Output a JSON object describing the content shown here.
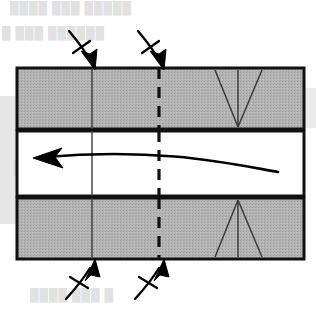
{
  "figure": {
    "kind": "technical-line-diagram",
    "scan_artifacts": {
      "ghost_text_visible": true,
      "ghost_lines": [
        "████ ███ █████",
        "█  ███  ██████",
        "███████  ████",
        "████  ███  █"
      ]
    },
    "colors": {
      "background": "#ffffff",
      "layer_fill": "#b2b2b2",
      "layer_stroke": "#111111",
      "interior_line": "#333333",
      "arrow": "#000000",
      "ghost_text": "#c9c9c9"
    },
    "geometry": {
      "block_left": 17,
      "block_right": 304,
      "top_band": {
        "y_top": 68,
        "y_bottom": 129,
        "label": "upper-layer"
      },
      "middle_band": {
        "y_top": 131,
        "y_bottom": 196,
        "label": "middle-layer"
      },
      "bottom_band": {
        "y_top": 198,
        "y_bottom": 259,
        "label": "lower-layer"
      },
      "solid_vertical_x": 92,
      "dashed_vertical_x": 159,
      "wedge_apex_x": 238
    },
    "elements": {
      "upper_layer": "upper shaded layer",
      "middle_layer": "middle unshaded layer",
      "lower_layer": "lower shaded layer",
      "solid_reference_line": "solid vertical reference line",
      "dashed_axial_line": "dashed vertical axial-plane line",
      "upper_wedge": "downward-converging wedge in upper layer",
      "lower_wedge": "upward-converging wedge in lower layer",
      "shear_arrow": "curved arrow pointing left through middle layer",
      "top_load_arrow_left": "downward load arrow, left",
      "top_load_arrow_right": "downward load arrow, right",
      "bottom_load_arrow_left": "upward load arrow, left",
      "bottom_load_arrow_right": "upward load arrow, right"
    },
    "annotations": {
      "arrow_tick_marks": 4,
      "shear_direction": "left",
      "load_arrow_count_top": 2,
      "load_arrow_count_bottom": 2
    }
  }
}
